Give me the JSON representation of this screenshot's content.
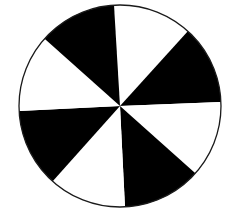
{
  "figure": {
    "type": "sector-disc",
    "sector_count": 8,
    "colors": {
      "dark": "#000000",
      "light": "#ffffff",
      "outline": "#1a1a1a",
      "background": "#ffffff"
    },
    "center": [
      120,
      106
    ],
    "radius": 101,
    "boundary_points": [
      [
        114,
        5
      ],
      [
        187,
        32
      ],
      [
        221,
        102
      ],
      [
        195,
        173
      ],
      [
        125,
        207
      ],
      [
        53,
        181
      ],
      [
        19,
        111
      ],
      [
        46,
        40
      ]
    ],
    "sector_fills": [
      "light",
      "dark",
      "light",
      "dark",
      "light",
      "dark",
      "light",
      "dark"
    ]
  }
}
